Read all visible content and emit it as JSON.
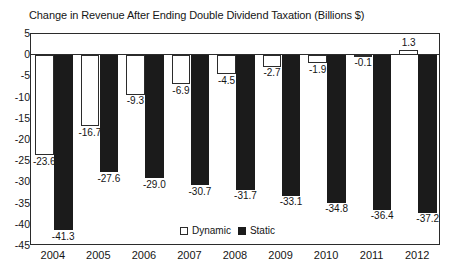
{
  "chart_data": {
    "type": "bar",
    "title": "Change in Revenue After Ending Double Dividend Taxation (Billions $)",
    "xlabel": "",
    "ylabel": "",
    "ylim": [
      -45,
      5
    ],
    "ytick_step": 5,
    "yticks": [
      "5",
      "0",
      "-5",
      "-10",
      "-15",
      "-20",
      "-25",
      "-30",
      "-35",
      "-40",
      "-45"
    ],
    "grid": false,
    "legend_position": "bottom-center",
    "categories": [
      "2004",
      "2005",
      "2006",
      "2007",
      "2008",
      "2009",
      "2010",
      "2011",
      "2012"
    ],
    "series": [
      {
        "name": "Dynamic",
        "color": "#ffffff",
        "values": [
          -23.6,
          -16.7,
          -9.3,
          -6.9,
          -4.5,
          -2.7,
          -1.9,
          -0.1,
          1.3
        ],
        "labels": [
          "-23.6",
          "-16.7",
          "-9.3",
          "-6.9",
          "-4.5",
          "-2.7",
          "-1.9",
          "-0.1",
          "1.3"
        ]
      },
      {
        "name": "Static",
        "color": "#1b1b1b",
        "values": [
          -41.3,
          -27.6,
          -29.0,
          -30.7,
          -31.7,
          -33.1,
          -34.8,
          -36.4,
          -37.2
        ],
        "labels": [
          "-41.3",
          "-27.6",
          "-29.0",
          "-30.7",
          "-31.7",
          "-33.1",
          "-34.8",
          "-36.4",
          "-37.2"
        ]
      }
    ]
  },
  "legend": {
    "dynamic_label": "Dynamic",
    "static_label": "Static"
  }
}
